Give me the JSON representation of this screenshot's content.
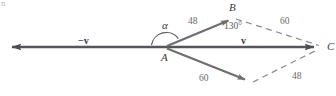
{
  "figure": {
    "type": "vector-parallelogram-diagram",
    "corner_mark": "n",
    "points": {
      "A": {
        "label": "A",
        "x": 165,
        "y": 47
      },
      "B": {
        "label": "B",
        "x": 232,
        "y": 18
      },
      "C": {
        "label": "C",
        "x": 322,
        "y": 47
      },
      "D": {
        "label": "",
        "x": 250,
        "y": 83
      }
    },
    "vectors": {
      "negative_v_label": "−v",
      "v_label": "v"
    },
    "magnitudes": {
      "ab": "48",
      "bc": "60",
      "ad": "60",
      "dc": "48"
    },
    "angles": {
      "alpha": "α",
      "at_b": "130°"
    },
    "colors": {
      "solid_arrow": "#6f6f72",
      "axis": "#55555a",
      "dashed": "#8e8e92",
      "text": "#3a3a3c",
      "magnitude_text": "#6a6a6c",
      "background": "#ffffff"
    }
  }
}
